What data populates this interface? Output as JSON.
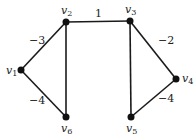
{
  "graph": {
    "nodes": [
      {
        "id": "v1",
        "label": "v",
        "sub": "1",
        "x": 21,
        "y": 70
      },
      {
        "id": "v2",
        "label": "v",
        "sub": "2",
        "x": 66,
        "y": 22
      },
      {
        "id": "v3",
        "label": "v",
        "sub": "3",
        "x": 130,
        "y": 21
      },
      {
        "id": "v4",
        "label": "v",
        "sub": "4",
        "x": 176,
        "y": 79
      },
      {
        "id": "v5",
        "label": "v",
        "sub": "5",
        "x": 131,
        "y": 117
      },
      {
        "id": "v6",
        "label": "v",
        "sub": "6",
        "x": 66,
        "y": 117
      }
    ],
    "edges": [
      {
        "from": "v1",
        "to": "v2",
        "weight": "−3"
      },
      {
        "from": "v1",
        "to": "v6",
        "weight": "−4"
      },
      {
        "from": "v2",
        "to": "v3",
        "weight": "1"
      },
      {
        "from": "v2",
        "to": "v6",
        "weight": ""
      },
      {
        "from": "v3",
        "to": "v4",
        "weight": "−2"
      },
      {
        "from": "v3",
        "to": "v5",
        "weight": ""
      },
      {
        "from": "v4",
        "to": "v5",
        "weight": "−4"
      }
    ]
  },
  "colors": {
    "edge": "#1a1a1a",
    "node": "#111111",
    "background": "#ffffff"
  }
}
